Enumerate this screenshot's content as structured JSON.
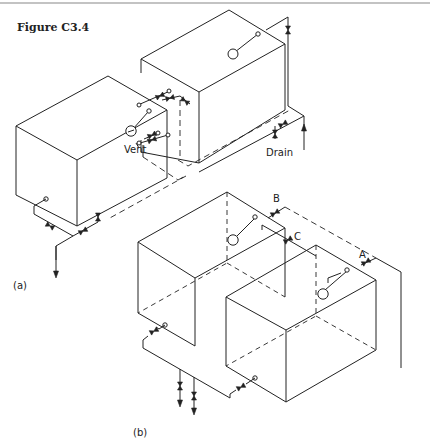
{
  "figure": {
    "title": "Figure C3.4",
    "top_rule_color": "#888888"
  },
  "part_a": {
    "label": "(a)",
    "annotations": {
      "vent": "Vent",
      "drain": "Drain"
    }
  },
  "part_b": {
    "label": "(b)",
    "annotations": {
      "a": "A",
      "b": "B",
      "c": "C"
    }
  },
  "colors": {
    "line": "#222222",
    "background": "#ffffff"
  }
}
